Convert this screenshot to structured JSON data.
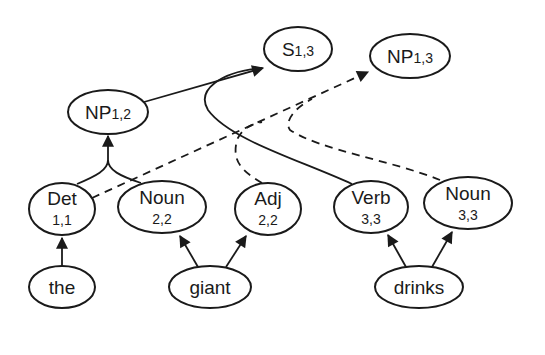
{
  "diagram": {
    "colors": {
      "stroke": "#1a1a1a",
      "fill": "#ffffff",
      "background": "#ffffff"
    },
    "nodes": [
      {
        "id": "S13",
        "label": "S",
        "span": "1,3",
        "span_style": "inline"
      },
      {
        "id": "NP13",
        "label": "NP",
        "span": "1,3",
        "span_style": "inline"
      },
      {
        "id": "NP12",
        "label": "NP",
        "span": "1,2",
        "span_style": "inline"
      },
      {
        "id": "Det11",
        "label": "Det",
        "span": "1,1",
        "span_style": "below"
      },
      {
        "id": "Noun22",
        "label": "Noun",
        "span": "2,2",
        "span_style": "below"
      },
      {
        "id": "Adj22",
        "label": "Adj",
        "span": "2,2",
        "span_style": "below"
      },
      {
        "id": "Verb33",
        "label": "Verb",
        "span": "3,3",
        "span_style": "below"
      },
      {
        "id": "Noun33",
        "label": "Noun",
        "span": "3,3",
        "span_style": "below"
      },
      {
        "id": "the",
        "label": "the"
      },
      {
        "id": "giant",
        "label": "giant"
      },
      {
        "id": "drinks",
        "label": "drinks"
      }
    ],
    "edges": [
      {
        "from": "the",
        "to": "Det11",
        "style": "solid"
      },
      {
        "from": "giant",
        "to": "Noun22",
        "style": "solid"
      },
      {
        "from": "giant",
        "to": "Adj22",
        "style": "solid"
      },
      {
        "from": "drinks",
        "to": "Verb33",
        "style": "solid"
      },
      {
        "from": "drinks",
        "to": "Noun33",
        "style": "solid"
      },
      {
        "from": [
          "Det11",
          "Noun22"
        ],
        "to": "NP12",
        "style": "solid"
      },
      {
        "from": [
          "NP12",
          "Verb33"
        ],
        "to": "S13",
        "style": "solid"
      },
      {
        "from": [
          "Det11",
          "Adj22",
          "Noun33"
        ],
        "to": "NP13",
        "style": "dashed"
      }
    ]
  }
}
